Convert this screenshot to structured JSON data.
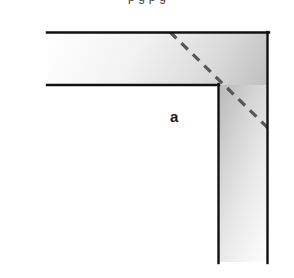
{
  "figure": {
    "clipped_caption": "p    g    p    g",
    "background_color": "#ffffff",
    "width": 294,
    "height": 278,
    "label_a": "a",
    "label_a_color": "#18181a",
    "outline_color": "#101010",
    "dashed_line_color": "#55555a",
    "gradient": {
      "light": "#ffffff",
      "mid": "#d8d8d8",
      "dark": "#b0b0b0"
    },
    "geometry": {
      "outer_top_y": 32,
      "inner_top_y": 85,
      "left_open_x": 48,
      "inner_corner_x": 218,
      "outer_right_x": 268,
      "bottom_open_y": 262,
      "dash_start": [
        170,
        32
      ],
      "dash_end": [
        268,
        128
      ]
    },
    "icon_names": [
      "corner-bracket-shape",
      "miter-dashed-line",
      "thickness-label"
    ]
  }
}
